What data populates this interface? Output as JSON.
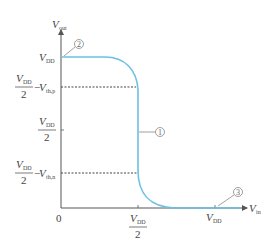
{
  "diagram": {
    "axes": {
      "y_label": {
        "main": "V",
        "sub": "out"
      },
      "x_label": {
        "main": "V",
        "sub": "in"
      },
      "origin_label": "0"
    },
    "y_ticks": [
      {
        "id": "vdd",
        "main": "V",
        "sub": "DD"
      },
      {
        "id": "vdd2-vthp",
        "num_main": "V",
        "num_sub": "DD",
        "den": "2",
        "minus": "−",
        "term_main": "V",
        "term_sub": "th,p"
      },
      {
        "id": "vdd2",
        "num_main": "V",
        "num_sub": "DD",
        "den": "2"
      },
      {
        "id": "vdd2-vthn",
        "num_main": "V",
        "num_sub": "DD",
        "den": "2",
        "minus": "−",
        "term_main": "V",
        "term_sub": "th,n"
      }
    ],
    "x_ticks": [
      {
        "id": "vdd2",
        "num_main": "V",
        "num_sub": "DD",
        "den": "2"
      },
      {
        "id": "vdd",
        "main": "V",
        "sub": "DD"
      }
    ],
    "annotations": [
      {
        "id": "region-1",
        "label": "①"
      },
      {
        "id": "region-2",
        "label": "②"
      },
      {
        "id": "region-3",
        "label": "③"
      }
    ],
    "colors": {
      "curve": "#6cc0e4",
      "axis": "#555555",
      "dashed": "#444444",
      "leader": "#777777"
    }
  }
}
